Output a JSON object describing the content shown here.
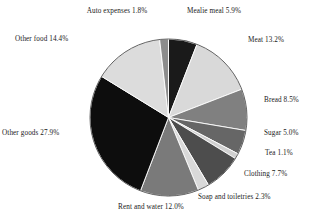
{
  "chart_data": {
    "type": "pie",
    "title": "",
    "subtitle": "",
    "xlabel": "",
    "ylabel": "",
    "legend_position": "none",
    "grid": false,
    "start_angle_deg": 0,
    "direction": "clockwise",
    "categories": [
      "Mealie meal",
      "Meat",
      "Bread",
      "Sugar",
      "Tea",
      "Clothing",
      "Soap and toiletries",
      "Rent and water",
      "Other goods",
      "Other food",
      "Auto expenses"
    ],
    "values": [
      5.9,
      13.2,
      8.5,
      5.0,
      1.1,
      7.7,
      2.3,
      12.0,
      27.9,
      14.4,
      1.8
    ],
    "unit": "%",
    "slices": [
      {
        "label": "Mealie meal 5.9%",
        "name": "Mealie meal",
        "value": 5.9,
        "color": "#1a1a1a"
      },
      {
        "label": "Meat 13.2%",
        "name": "Meat",
        "value": 13.2,
        "color": "#d9d9d9"
      },
      {
        "label": "Bread 8.5%",
        "name": "Bread",
        "value": 8.5,
        "color": "#808080"
      },
      {
        "label": "Sugar 5.0%",
        "name": "Sugar",
        "value": 5.0,
        "color": "#666666"
      },
      {
        "label": "Tea 1.1%",
        "name": "Tea",
        "value": 1.1,
        "color": "#d0d0d0"
      },
      {
        "label": "Clothing 7.7%",
        "name": "Clothing",
        "value": 7.7,
        "color": "#4d4d4d"
      },
      {
        "label": "Soap and toiletries 2.3%",
        "name": "Soap and toiletries",
        "value": 2.3,
        "color": "#d9d9d9"
      },
      {
        "label": "Rent and water 12.0%",
        "name": "Rent and water",
        "value": 12.0,
        "color": "#7a7a7a"
      },
      {
        "label": "Other goods 27.9%",
        "name": "Other goods",
        "value": 27.9,
        "color": "#0d0d0d"
      },
      {
        "label": "Other food 14.4%",
        "name": "Other food",
        "value": 14.4,
        "color": "#dcdcdc"
      },
      {
        "label": "Auto expenses 1.8%",
        "name": "Auto expenses",
        "value": 1.8,
        "color": "#8c8c8c"
      }
    ]
  }
}
